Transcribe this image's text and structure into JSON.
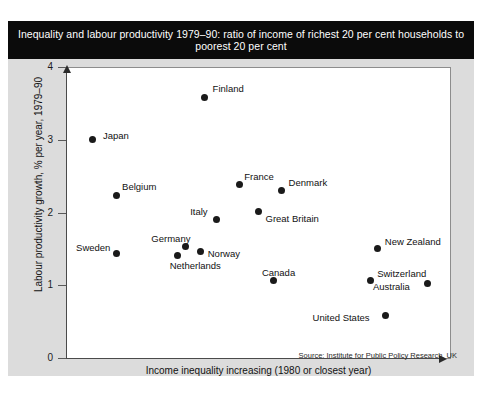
{
  "title": "Inequality and labour productivity 1979–90: ratio of income of richest 20 per cent households to poorest 20 per cent",
  "source": "Source: Institute for Public Policy Research, UK",
  "chart_data": {
    "type": "scatter",
    "title": "Inequality and labour productivity 1979–90: ratio of income of richest 20 per cent households to poorest 20 per cent",
    "xlabel": "Income inequality increasing (1980 or closest year)",
    "ylabel": "Labour productivity growth, % per year, 1979–90",
    "ylim": [
      0,
      4
    ],
    "yticks": [
      "0",
      "1",
      "2",
      "3",
      "4"
    ],
    "xticks": [],
    "grid": false,
    "legend": "none",
    "note": "x axis is unlabelled/ordinal – income inequality increasing left to right",
    "points": [
      {
        "label": "Japan",
        "x": 0.07,
        "y": 3.0,
        "label_dx": 10,
        "label_dy": -10
      },
      {
        "label": "Finland",
        "x": 0.36,
        "y": 3.58,
        "label_dx": 8,
        "label_dy": -15
      },
      {
        "label": "Belgium",
        "x": 0.13,
        "y": 2.24,
        "label_dx": 6,
        "label_dy": -14
      },
      {
        "label": "France",
        "x": 0.45,
        "y": 2.38,
        "label_dx": 5,
        "label_dy": -14
      },
      {
        "label": "Denmark",
        "x": 0.56,
        "y": 2.3,
        "label_dx": 7,
        "label_dy": -14
      },
      {
        "label": "Great Britain",
        "x": 0.5,
        "y": 2.01,
        "label_dx": 7,
        "label_dy": 1
      },
      {
        "label": "Italy",
        "x": 0.39,
        "y": 1.9,
        "label_dx": -26,
        "label_dy": -14
      },
      {
        "label": "Germany",
        "x": 0.31,
        "y": 1.53,
        "label_dx": -34,
        "label_dy": -14
      },
      {
        "label": "Norway",
        "x": 0.35,
        "y": 1.47,
        "label_dx": 7,
        "label_dy": -3
      },
      {
        "label": "Netherlands",
        "x": 0.29,
        "y": 1.41,
        "label_dx": -8,
        "label_dy": 5
      },
      {
        "label": "Sweden",
        "x": 0.13,
        "y": 1.44,
        "label_dx": -40,
        "label_dy": -11
      },
      {
        "label": "Canada",
        "x": 0.54,
        "y": 1.06,
        "label_dx": -12,
        "label_dy": -14
      },
      {
        "label": "New Zealand",
        "x": 0.81,
        "y": 1.5,
        "label_dx": 7,
        "label_dy": -13
      },
      {
        "label": "Switzerland",
        "x": 0.79,
        "y": 1.06,
        "label_dx": 7,
        "label_dy": -13
      },
      {
        "label": "Australia",
        "x": 0.94,
        "y": 1.02,
        "label_dx": -55,
        "label_dy": -3
      },
      {
        "label": "United States",
        "x": 0.83,
        "y": 0.59,
        "label_dx": -73,
        "label_dy": -3
      }
    ]
  },
  "colors": {
    "banner_bg": "#0b0b0b",
    "banner_text": "#ffffff",
    "card_bg": "#dcdcdc",
    "plot_bg": "#ffffff",
    "marker": "#1a1a1a",
    "axis": "#4a4a4a"
  }
}
